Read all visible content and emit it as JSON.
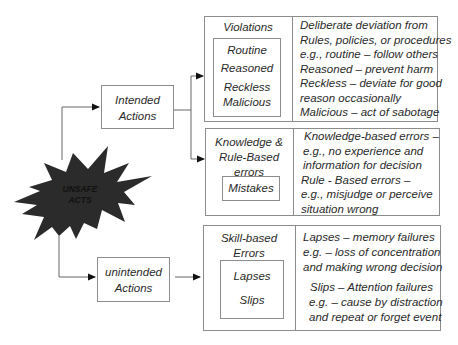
{
  "center": {
    "label_line1": "UNSAFE",
    "label_line2": "ACTS"
  },
  "intended": {
    "line1": "Intended",
    "line2": "Actions"
  },
  "unintended": {
    "line1": "unintended",
    "line2": "Actions"
  },
  "violations": {
    "title": "Violations",
    "items": [
      "Routine",
      "Reasoned",
      "Reckless",
      "Malicious"
    ],
    "description": [
      "Deliberate deviation from",
      "Rules, policies, or procedures",
      "e.g., routine – follow others",
      "Reasoned – prevent harm",
      "Reckless – deviate for good",
      "reason occasionally",
      "Malicious – act of sabotage"
    ]
  },
  "knowledge": {
    "title_lines": [
      "Knowledge &",
      "Rule-Based",
      "errors"
    ],
    "items": [
      "Mistakes"
    ],
    "description": [
      "Knowledge-based errors –",
      "e.g., no experience and",
      "information for decision",
      "Rule - Based errors –",
      "e.g., misjudge or perceive",
      "situation wrong"
    ]
  },
  "skill": {
    "title_lines": [
      "Skill-based",
      "Errors"
    ],
    "items": [
      "Lapses",
      "Slips"
    ],
    "description": [
      "Lapses – memory failures",
      "e.g. – loss of concentration",
      "and making wrong decision",
      "Slips – Attention failures",
      "e.g. – cause by distraction",
      "and repeat or forget event"
    ]
  },
  "colors": {
    "starburst": "#2b2b2b",
    "border": "#8c8c8c",
    "line": "#555555"
  }
}
